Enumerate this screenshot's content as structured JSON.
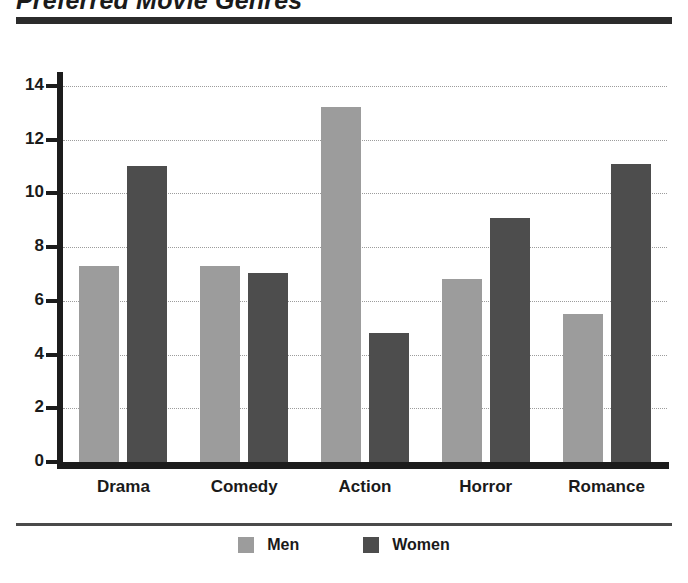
{
  "title": "Preferred Movie Genres",
  "legend": {
    "items": [
      {
        "label": "Men",
        "color": "#9c9c9c",
        "swatch_name": "legend-swatch-men"
      },
      {
        "label": "Women",
        "color": "#4d4d4d",
        "swatch_name": "legend-swatch-women"
      }
    ]
  },
  "axis": {
    "y_ticks": [
      "0",
      "2",
      "4",
      "6",
      "8",
      "10",
      "12",
      "14"
    ],
    "x_categories": [
      "Drama",
      "Comedy",
      "Action",
      "Horror",
      "Romance"
    ]
  },
  "chart_data": {
    "type": "bar",
    "title": "Preferred Movie Genres",
    "xlabel": "",
    "ylabel": "",
    "categories": [
      "Drama",
      "Comedy",
      "Action",
      "Horror",
      "Romance"
    ],
    "series": [
      {
        "name": "Men",
        "color": "#9c9c9c",
        "values": [
          7.3,
          7.3,
          13.2,
          6.8,
          5.5
        ]
      },
      {
        "name": "Women",
        "color": "#4d4d4d",
        "values": [
          11.0,
          7.05,
          4.8,
          9.1,
          11.1
        ]
      }
    ],
    "ylim": [
      0,
      15
    ],
    "ytick_values": [
      0,
      2,
      4,
      6,
      8,
      10,
      12,
      14
    ],
    "grid": "horizontal-dotted",
    "legend_position": "bottom-center",
    "orientation": "vertical",
    "grouping": "grouped"
  }
}
